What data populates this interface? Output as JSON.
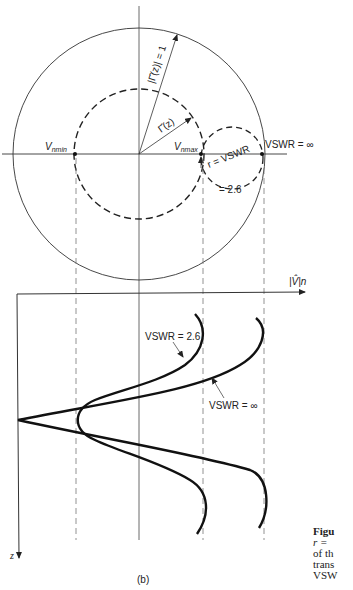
{
  "figure": {
    "panel_label": "(b)",
    "upper": {
      "gamma_unit_label": "|Γ̂(z)| = 1",
      "gamma_label": "Γ̂(z)",
      "vnmin_label": "Vnmin",
      "vnmin_main": "V",
      "vnmin_sub": "nmin",
      "vnmax_main": "V",
      "vnmax_sub": "nmax",
      "vswr_inf_label": "VSWR = ∞",
      "r_label": "r = VSWR",
      "r_value_label": "= 2.6"
    },
    "lower": {
      "y_axis_label": "|V̂|n",
      "z_axis_label": "z",
      "curve1_label": "VSWR = 2.6",
      "curve2_label": "VSWR = ∞"
    },
    "caption_fragment": {
      "line1": "Figu",
      "line2": "r = ",
      "line3": "of th",
      "line4": "trans",
      "line5": "VSW"
    }
  },
  "colors": {
    "ink": "#222222",
    "dashed": "#777777",
    "background": "#ffffff"
  }
}
